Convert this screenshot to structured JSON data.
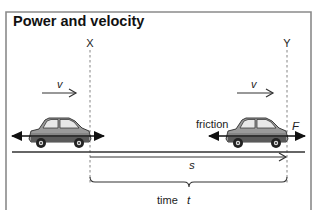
{
  "diagram": {
    "title": "Power and velocity",
    "markers": [
      {
        "id": "X",
        "label": "X"
      },
      {
        "id": "Y",
        "label": "Y"
      }
    ],
    "velocity_labels": [
      "v",
      "v"
    ],
    "force_labels": {
      "friction": "friction",
      "driving_force": "F"
    },
    "distance_label": "s",
    "time_label": "time",
    "time_symbol": "t",
    "colors": {
      "frame": "#8a8a8a",
      "ink": "#1a1a1a",
      "car_body": "#8f8f8f",
      "car_dark": "#3a3a3a",
      "dashed": "#777777"
    }
  }
}
